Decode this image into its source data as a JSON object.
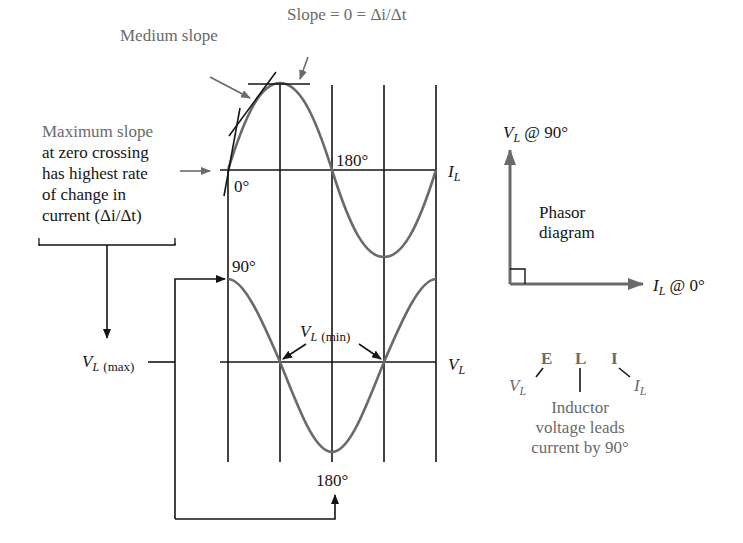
{
  "colors": {
    "curve": "#6a6a6a",
    "grid": "#151515",
    "annotation_gray": "#6a6a6a",
    "text_black": "#151515",
    "phasor_arrow": "#6a6a6a"
  },
  "annotations": {
    "slope_zero": "Slope = 0 = Δi/Δt",
    "medium_slope": "Medium slope",
    "max_slope_line1": "Maximum slope",
    "max_slope_line2": "at zero crossing",
    "max_slope_line3": "has highest rate",
    "max_slope_line4": "of change in",
    "max_slope_line5": "current (Δi/Δt)"
  },
  "current_wave": {
    "axis_label": "I",
    "axis_sub": "L",
    "label_0": "0°",
    "label_180": "180°"
  },
  "voltage_wave": {
    "axis_label": "V",
    "axis_sub": "L",
    "label_90": "90°",
    "label_180": "180°",
    "vmax_label": "V",
    "vmax_sub": "L",
    "vmax_paren": "(max)",
    "vmin_label": "V",
    "vmin_sub": "L",
    "vmin_paren": "(min)"
  },
  "phasor": {
    "vl_label": "V",
    "vl_sub": "L",
    "vl_angle": "@ 90°",
    "il_label": "I",
    "il_sub": "L",
    "il_angle": "@ 0°",
    "title_line1": "Phasor",
    "title_line2": "diagram"
  },
  "eli": {
    "letters": [
      "E",
      "L",
      "I"
    ],
    "v_label": "V",
    "v_sub": "L",
    "i_label": "I",
    "i_sub": "L",
    "caption_line1": "Inductor",
    "caption_line2": "voltage leads",
    "caption_line3": "current by 90°"
  }
}
